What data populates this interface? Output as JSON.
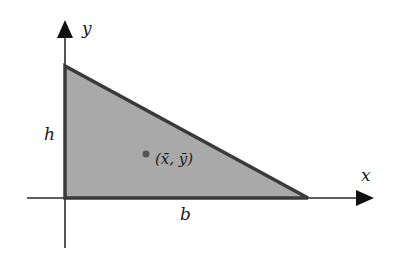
{
  "diagram": {
    "type": "right-triangle-centroid",
    "labels": {
      "y_axis": "y",
      "x_axis": "x",
      "height": "h",
      "base": "b",
      "centroid": "(x̄, ȳ)"
    },
    "colors": {
      "fill": "#a9a9a9",
      "stroke": "#3a3a3a",
      "axis": "#2a2a2a",
      "point": "#555555",
      "text": "#1a1a1a"
    }
  }
}
